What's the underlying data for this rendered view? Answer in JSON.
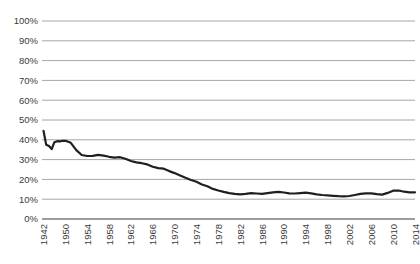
{
  "figure": {
    "background": "#ffffff"
  },
  "chart_data": {
    "type": "line",
    "title": "",
    "xlabel": "",
    "ylabel": "",
    "ylim": [
      0,
      100
    ],
    "grid": "horizontal-only",
    "legend": "none",
    "y_tick_labels": [
      "100%",
      "90%",
      "80%",
      "70%",
      "60%",
      "50%",
      "40%",
      "30%",
      "20%",
      "10%",
      "0%"
    ],
    "x_tick_labels": [
      "1942",
      "1950",
      "1954",
      "1958",
      "1962",
      "1966",
      "1970",
      "1974",
      "1978",
      "1982",
      "1986",
      "1990",
      "1994",
      "1998",
      "2002",
      "2006",
      "2010",
      "2014"
    ],
    "x_tick_style": "rotated-90-reading-bottom-to-top, evenly spaced; first interval spans 1942-1950",
    "points": [
      [
        1942,
        44.5
      ],
      [
        1943,
        37.5
      ],
      [
        1944,
        36.8
      ],
      [
        1945,
        35.3
      ],
      [
        1946,
        38.8
      ],
      [
        1947,
        39.3
      ],
      [
        1948,
        39.2
      ],
      [
        1949,
        39.5
      ],
      [
        1950,
        39.5
      ],
      [
        1951,
        38.5
      ],
      [
        1952,
        34.8
      ],
      [
        1953,
        32.3
      ],
      [
        1954,
        31.8
      ],
      [
        1955,
        31.9
      ],
      [
        1956,
        32.4
      ],
      [
        1957,
        32.0
      ],
      [
        1958,
        31.4
      ],
      [
        1959,
        31.0
      ],
      [
        1960,
        31.2
      ],
      [
        1961,
        30.4
      ],
      [
        1962,
        29.3
      ],
      [
        1963,
        28.6
      ],
      [
        1964,
        28.2
      ],
      [
        1965,
        27.6
      ],
      [
        1966,
        26.4
      ],
      [
        1967,
        25.7
      ],
      [
        1968,
        25.4
      ],
      [
        1969,
        24.2
      ],
      [
        1970,
        23.2
      ],
      [
        1971,
        22.0
      ],
      [
        1972,
        20.8
      ],
      [
        1973,
        19.7
      ],
      [
        1974,
        18.8
      ],
      [
        1975,
        17.4
      ],
      [
        1976,
        16.5
      ],
      [
        1977,
        15.2
      ],
      [
        1978,
        14.4
      ],
      [
        1979,
        13.7
      ],
      [
        1980,
        13.1
      ],
      [
        1981,
        12.7
      ],
      [
        1982,
        12.5
      ],
      [
        1983,
        12.7
      ],
      [
        1984,
        13.1
      ],
      [
        1985,
        12.9
      ],
      [
        1986,
        12.7
      ],
      [
        1987,
        13.1
      ],
      [
        1988,
        13.5
      ],
      [
        1989,
        13.7
      ],
      [
        1990,
        13.4
      ],
      [
        1991,
        13.0
      ],
      [
        1992,
        12.9
      ],
      [
        1993,
        13.1
      ],
      [
        1994,
        13.3
      ],
      [
        1995,
        13.0
      ],
      [
        1996,
        12.5
      ],
      [
        1997,
        12.1
      ],
      [
        1998,
        11.9
      ],
      [
        1999,
        11.7
      ],
      [
        2000,
        11.5
      ],
      [
        2001,
        11.4
      ],
      [
        2002,
        11.6
      ],
      [
        2003,
        12.1
      ],
      [
        2004,
        12.7
      ],
      [
        2005,
        13.0
      ],
      [
        2006,
        13.0
      ],
      [
        2007,
        12.6
      ],
      [
        2008,
        12.3
      ],
      [
        2009,
        13.2
      ],
      [
        2010,
        14.3
      ],
      [
        2011,
        14.4
      ],
      [
        2012,
        13.8
      ],
      [
        2013,
        13.5
      ],
      [
        2014,
        13.5
      ]
    ],
    "colors": {
      "line": "#1f1f1f",
      "grid": "#a6a6a6",
      "axis": "#7d7d7d",
      "text": "#3a3a3a"
    }
  }
}
